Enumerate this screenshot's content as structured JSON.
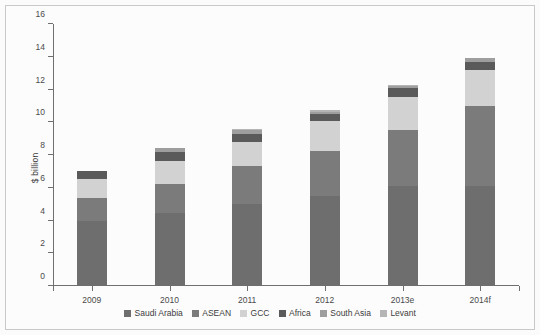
{
  "chart_data": {
    "type": "bar",
    "subtype": "stacked-bar",
    "title": "",
    "xlabel": "",
    "ylabel": "$ billion",
    "categories": [
      "2009",
      "2010",
      "2011",
      "2012",
      "2013e",
      "2014f"
    ],
    "ylim": [
      0,
      16
    ],
    "yticks": [
      0,
      2,
      4,
      6,
      8,
      10,
      12,
      14,
      16
    ],
    "ytick_labels": [
      "0",
      "2",
      "4",
      "6",
      "8",
      "10",
      "12",
      "14",
      "16"
    ],
    "grid": false,
    "legend_position": "bottom",
    "series": [
      {
        "name": "Saudi Arabia",
        "color": "#6e6e6e",
        "values": [
          3.95,
          4.45,
          5.0,
          5.5,
          6.1,
          6.1
        ]
      },
      {
        "name": "ASEAN",
        "color": "#7b7b7b",
        "values": [
          1.45,
          1.75,
          2.3,
          2.75,
          3.4,
          4.9
        ]
      },
      {
        "name": "GCC",
        "color": "#d2d2d2",
        "values": [
          1.15,
          1.45,
          1.5,
          1.85,
          2.05,
          2.2
        ]
      },
      {
        "name": "Africa",
        "color": "#5a5a5a",
        "values": [
          0.45,
          0.55,
          0.5,
          0.4,
          0.55,
          0.5
        ]
      },
      {
        "name": "South Asia",
        "color": "#9e9e9e",
        "values": [
          0.0,
          0.2,
          0.2,
          0.15,
          0.1,
          0.2
        ]
      },
      {
        "name": "Levant",
        "color": "#b5b5b5",
        "values": [
          0.0,
          0.0,
          0.1,
          0.1,
          0.05,
          0.05
        ]
      }
    ],
    "totals": [
      7.0,
      8.4,
      9.6,
      10.75,
      12.25,
      13.95
    ]
  },
  "legend": {
    "items": [
      {
        "label": "Saudi Arabia",
        "color": "#6e6e6e"
      },
      {
        "label": "ASEAN",
        "color": "#7b7b7b"
      },
      {
        "label": "GCC",
        "color": "#d2d2d2"
      },
      {
        "label": "Africa",
        "color": "#5a5a5a"
      },
      {
        "label": "South Asia",
        "color": "#9e9e9e"
      },
      {
        "label": "Levant",
        "color": "#b5b5b5"
      }
    ]
  },
  "axes": {
    "y_label": "$ billion",
    "y_ticks": [
      "0",
      "2",
      "4",
      "6",
      "8",
      "10",
      "12",
      "14",
      "16"
    ],
    "x_ticks": [
      "2009",
      "2010",
      "2011",
      "2012",
      "2013e",
      "2014f"
    ]
  },
  "colors": {
    "background": "#fcfcfc",
    "border": "#c9c9c9",
    "axis": "#6f6f6f",
    "text": "#3c3c3c"
  }
}
